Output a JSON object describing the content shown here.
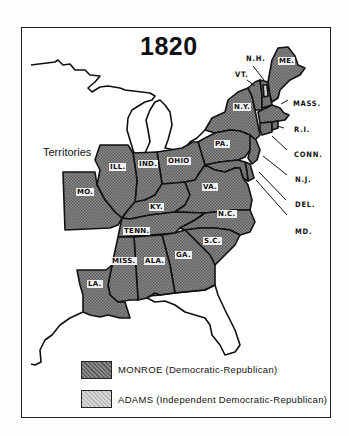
{
  "map": {
    "title": "1820",
    "territories_label": "Territories",
    "colors": {
      "monroe_fill": "#7d7d7d",
      "adams_fill": "#c8c8c8",
      "border": "#111111",
      "background": "#ffffff"
    },
    "states": [
      {
        "abbr": "ME.",
        "winner": "Monroe"
      },
      {
        "abbr": "N.H.",
        "winner": "Monroe"
      },
      {
        "abbr": "VT.",
        "winner": "Monroe"
      },
      {
        "abbr": "MASS.",
        "winner": "Monroe"
      },
      {
        "abbr": "R.I.",
        "winner": "Monroe"
      },
      {
        "abbr": "CONN.",
        "winner": "Monroe"
      },
      {
        "abbr": "N.Y.",
        "winner": "Monroe"
      },
      {
        "abbr": "N.J.",
        "winner": "Monroe"
      },
      {
        "abbr": "PA.",
        "winner": "Monroe"
      },
      {
        "abbr": "DEL.",
        "winner": "Monroe"
      },
      {
        "abbr": "MD.",
        "winner": "Monroe"
      },
      {
        "abbr": "VA.",
        "winner": "Monroe"
      },
      {
        "abbr": "N.C.",
        "winner": "Monroe"
      },
      {
        "abbr": "S.C.",
        "winner": "Monroe"
      },
      {
        "abbr": "GA.",
        "winner": "Monroe"
      },
      {
        "abbr": "OHIO",
        "winner": "Monroe"
      },
      {
        "abbr": "IND.",
        "winner": "Monroe"
      },
      {
        "abbr": "ILL.",
        "winner": "Monroe"
      },
      {
        "abbr": "KY.",
        "winner": "Monroe"
      },
      {
        "abbr": "TENN.",
        "winner": "Monroe"
      },
      {
        "abbr": "MO.",
        "winner": "Monroe"
      },
      {
        "abbr": "MISS.",
        "winner": "Monroe"
      },
      {
        "abbr": "ALA.",
        "winner": "Monroe"
      },
      {
        "abbr": "LA.",
        "winner": "Monroe"
      }
    ],
    "callouts": {
      "nh": "N.H.",
      "vt": "VT.",
      "mass": "MASS.",
      "ri": "R.I.",
      "conn": "CONN.",
      "nj": "N.J.",
      "del": "DEL.",
      "md": "MD."
    },
    "inline": {
      "me": "ME.",
      "ny": "N.Y.",
      "pa": "PA.",
      "ohio": "OHIO",
      "ind": "IND.",
      "ill": "ILL.",
      "mo": "MO.",
      "ky": "KY.",
      "va": "VA.",
      "nc": "N.C.",
      "tenn": "TENN.",
      "sc": "S.C.",
      "miss": "MISS.",
      "ala": "ALA.",
      "ga": "GA.",
      "la": "LA."
    }
  },
  "legend": {
    "items": [
      {
        "label": "MONROE (Democratic-Republican)",
        "color": "#7d7d7d"
      },
      {
        "label": "ADAMS (Independent Democratic-Republican)",
        "color": "#c8c8c8"
      }
    ]
  }
}
